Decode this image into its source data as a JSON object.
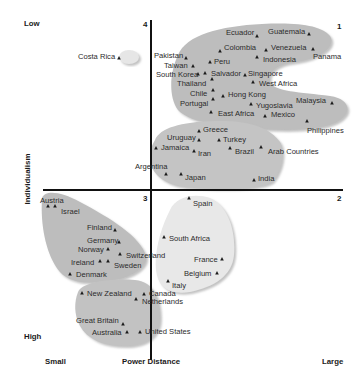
{
  "chart_data": {
    "type": "scatter",
    "title": "",
    "xlabel": "Power Distance",
    "ylabel": "Individualism",
    "x_ends": {
      "left": "Small",
      "right": "Large"
    },
    "y_ends": {
      "top": "Low",
      "bottom": "High"
    },
    "quadrants": {
      "q1": "1",
      "q2": "2",
      "q3": "3",
      "q4": "4"
    },
    "grid": false,
    "clusters": [
      {
        "name": "cluster-costa-rica",
        "color": "#e6e6e6",
        "members": [
          "Costa Rica"
        ]
      },
      {
        "name": "cluster-latin-asia-large-pd",
        "color": "#bdbdbd",
        "members": [
          "Pakistan",
          "Taiwan",
          "South Korea",
          "Thailand",
          "Chile",
          "Portugal",
          "Ecuador",
          "Guatemala",
          "Colombia",
          "Venezuela",
          "Panama",
          "Peru",
          "Indonesia",
          "Salvador",
          "Singapore",
          "West Africa",
          "Hong Kong",
          "Yugoslavia",
          "East Africa",
          "Mexico",
          "Malaysia",
          "Philippines"
        ]
      },
      {
        "name": "cluster-mid-pd",
        "color": "#c4c4c4",
        "members": [
          "Greece",
          "Uruguay",
          "Turkey",
          "Jamaica",
          "Iran",
          "Brazil",
          "Arab Countries",
          "Argentina",
          "Japan",
          "India"
        ]
      },
      {
        "name": "cluster-nordic-germanic",
        "color": "#bdbdbd",
        "members": [
          "Austria",
          "Israel",
          "Finland",
          "Germany",
          "Norway",
          "Switzerland",
          "Ireland",
          "Sweden",
          "Denmark"
        ]
      },
      {
        "name": "cluster-latin-europe",
        "color": "#e8e8e8",
        "members": [
          "Spain",
          "South Africa",
          "France",
          "Belgium",
          "Italy"
        ]
      },
      {
        "name": "cluster-anglo",
        "color": "#c2c2c2",
        "members": [
          "New Zealand",
          "Canada",
          "Netherlands",
          "Great Britain",
          "Australia",
          "United States"
        ]
      }
    ],
    "points": [
      {
        "label": "Costa Rica",
        "x": 119,
        "y": 58,
        "lx": 78,
        "ly": 53
      },
      {
        "label": "Ecuador",
        "x": 257,
        "y": 36,
        "lx": 226,
        "ly": 29
      },
      {
        "label": "Guatemala",
        "x": 309,
        "y": 34,
        "lx": 268,
        "ly": 28
      },
      {
        "label": "Colombia",
        "x": 220,
        "y": 51,
        "lx": 224,
        "ly": 44
      },
      {
        "label": "Venezuela",
        "x": 266,
        "y": 50,
        "lx": 271,
        "ly": 44
      },
      {
        "label": "Panama",
        "x": 313,
        "y": 49,
        "lx": 313,
        "ly": 53
      },
      {
        "label": "Indonesia",
        "x": 257,
        "y": 57,
        "lx": 263,
        "ly": 56
      },
      {
        "label": "Pakistan",
        "x": 186,
        "y": 58,
        "lx": 154,
        "ly": 52
      },
      {
        "label": "Taiwan",
        "x": 193,
        "y": 66,
        "lx": 164,
        "ly": 62
      },
      {
        "label": "Peru",
        "x": 210,
        "y": 62,
        "lx": 214,
        "ly": 58
      },
      {
        "label": "South Korea",
        "x": 198,
        "y": 74,
        "lx": 156,
        "ly": 71
      },
      {
        "label": "Salvador",
        "x": 205,
        "y": 73,
        "lx": 211,
        "ly": 70
      },
      {
        "label": "Singapore",
        "x": 245,
        "y": 75,
        "lx": 248,
        "ly": 70
      },
      {
        "label": "Thailand",
        "x": 212,
        "y": 79,
        "lx": 177,
        "ly": 80
      },
      {
        "label": "West Africa",
        "x": 253,
        "y": 82,
        "lx": 259,
        "ly": 80
      },
      {
        "label": "Chile",
        "x": 213,
        "y": 90,
        "lx": 190,
        "ly": 90
      },
      {
        "label": "Hong Kong",
        "x": 223,
        "y": 96,
        "lx": 228,
        "ly": 91
      },
      {
        "label": "Portugal",
        "x": 213,
        "y": 99,
        "lx": 180,
        "ly": 100
      },
      {
        "label": "Yugoslavia",
        "x": 251,
        "y": 104,
        "lx": 256,
        "ly": 102
      },
      {
        "label": "Malaysia",
        "x": 332,
        "y": 103,
        "lx": 296,
        "ly": 97
      },
      {
        "label": "East Africa",
        "x": 211,
        "y": 112,
        "lx": 218,
        "ly": 110
      },
      {
        "label": "Mexico",
        "x": 265,
        "y": 116,
        "lx": 271,
        "ly": 111
      },
      {
        "label": "Philippines",
        "x": 307,
        "y": 121,
        "lx": 307,
        "ly": 127
      },
      {
        "label": "Greece",
        "x": 199,
        "y": 131,
        "lx": 203,
        "ly": 126
      },
      {
        "label": "Uruguay",
        "x": 199,
        "y": 140,
        "lx": 167,
        "ly": 134
      },
      {
        "label": "Turkey",
        "x": 219,
        "y": 140,
        "lx": 223,
        "ly": 136
      },
      {
        "label": "Jamaica",
        "x": 156,
        "y": 148,
        "lx": 161,
        "ly": 144
      },
      {
        "label": "Iran",
        "x": 194,
        "y": 151,
        "lx": 198,
        "ly": 150
      },
      {
        "label": "Brazil",
        "x": 230,
        "y": 148,
        "lx": 235,
        "ly": 148
      },
      {
        "label": "Arab Countries",
        "x": 261,
        "y": 147,
        "lx": 268,
        "ly": 148
      },
      {
        "label": "Argentina",
        "x": 166,
        "y": 174,
        "lx": 135,
        "ly": 163
      },
      {
        "label": "Japan",
        "x": 181,
        "y": 174,
        "lx": 185,
        "ly": 174
      },
      {
        "label": "India",
        "x": 254,
        "y": 180,
        "lx": 258,
        "ly": 175
      },
      {
        "label": "Austria",
        "x": 48,
        "y": 206,
        "lx": 40,
        "ly": 197
      },
      {
        "label": "Israel",
        "x": 55,
        "y": 206,
        "lx": 61,
        "ly": 208
      },
      {
        "label": "Finland",
        "x": 115,
        "y": 230,
        "lx": 87,
        "ly": 224
      },
      {
        "label": "Germany",
        "x": 119,
        "y": 242,
        "lx": 87,
        "ly": 237
      },
      {
        "label": "Norway",
        "x": 108,
        "y": 249,
        "lx": 78,
        "ly": 246
      },
      {
        "label": "Switzerland",
        "x": 120,
        "y": 254,
        "lx": 126,
        "ly": 252
      },
      {
        "label": "Ireland",
        "x": 100,
        "y": 261,
        "lx": 71,
        "ly": 259
      },
      {
        "label": "Sweden",
        "x": 108,
        "y": 261,
        "lx": 114,
        "ly": 262
      },
      {
        "label": "Denmark",
        "x": 70,
        "y": 274,
        "lx": 76,
        "ly": 271
      },
      {
        "label": "Spain",
        "x": 189,
        "y": 198,
        "lx": 193,
        "ly": 200
      },
      {
        "label": "South Africa",
        "x": 164,
        "y": 237,
        "lx": 169,
        "ly": 235
      },
      {
        "label": "France",
        "x": 222,
        "y": 259,
        "lx": 194,
        "ly": 256
      },
      {
        "label": "Belgium",
        "x": 217,
        "y": 273,
        "lx": 184,
        "ly": 270
      },
      {
        "label": "Italy",
        "x": 168,
        "y": 281,
        "lx": 172,
        "ly": 282
      },
      {
        "label": "New Zealand",
        "x": 82,
        "y": 293,
        "lx": 87,
        "ly": 290
      },
      {
        "label": "Canada",
        "x": 144,
        "y": 294,
        "lx": 149,
        "ly": 290
      },
      {
        "label": "Netherlands",
        "x": 136,
        "y": 299,
        "lx": 142,
        "ly": 298
      },
      {
        "label": "Great Britain",
        "x": 123,
        "y": 324,
        "lx": 76,
        "ly": 317
      },
      {
        "label": "Australia",
        "x": 127,
        "y": 332,
        "lx": 92,
        "ly": 329
      },
      {
        "label": "United States",
        "x": 140,
        "y": 332,
        "lx": 145,
        "ly": 328
      }
    ]
  }
}
